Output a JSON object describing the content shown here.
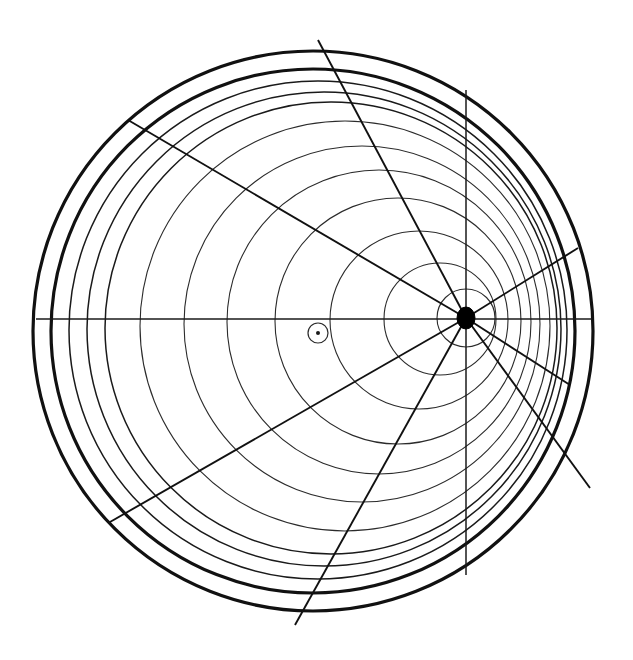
{
  "figure": {
    "kind": "geometric-diagram",
    "background_color": "#ffffff",
    "ink_color": "#111111",
    "canvas": {
      "width": 633,
      "height": 660
    }
  },
  "chart_data": {
    "type": "scatter",
    "subtitle": "",
    "xlabel": "",
    "ylabel": "",
    "xlim": [
      0,
      633
    ],
    "ylim": [
      660,
      0
    ],
    "grid": false,
    "legend": "none",
    "annotations": [],
    "tick_labels": {
      "x": [],
      "y": []
    },
    "geometry": {
      "primary_center": {
        "x": 313,
        "y": 331,
        "label": ""
      },
      "secondary_center": {
        "x": 318,
        "y": 333,
        "label": ""
      },
      "eccentric_node": {
        "x": 466,
        "y": 318,
        "label": ""
      },
      "node_radius": 9,
      "node_ring_radius": 29,
      "marker_ring_radius": 10,
      "marker_dot_radius": 2,
      "circles": [
        {
          "cx": 313,
          "cy": 331,
          "r": 280,
          "weight": "thick"
        },
        {
          "cx": 313,
          "cy": 331,
          "r": 262,
          "weight": "thick"
        },
        {
          "cx": 318,
          "cy": 330,
          "r": 249,
          "weight": "medium"
        },
        {
          "cx": 324,
          "cy": 329,
          "r": 237,
          "weight": "medium"
        },
        {
          "cx": 331,
          "cy": 328,
          "r": 226,
          "weight": "medium"
        },
        {
          "cx": 345,
          "cy": 326,
          "r": 205,
          "weight": "thin"
        },
        {
          "cx": 362,
          "cy": 324,
          "r": 178,
          "weight": "thin"
        },
        {
          "cx": 379,
          "cy": 322,
          "r": 152,
          "weight": "thin"
        },
        {
          "cx": 398,
          "cy": 321,
          "r": 123,
          "weight": "thin"
        },
        {
          "cx": 419,
          "cy": 320,
          "r": 89,
          "weight": "thin"
        },
        {
          "cx": 440,
          "cy": 319,
          "r": 56,
          "weight": "thin"
        },
        {
          "cx": 466,
          "cy": 318,
          "r": 29,
          "weight": "thin"
        }
      ],
      "lines": [
        {
          "name": "horizontal-axis",
          "x1": 36,
          "y1": 319,
          "x2": 592,
          "y2": 319,
          "weight": "axis"
        },
        {
          "name": "vertical-axis",
          "x1": 466,
          "y1": 90,
          "x2": 466,
          "y2": 575,
          "weight": "axis"
        },
        {
          "name": "ray-upper-left",
          "x1": 466,
          "y1": 318,
          "x2": 128,
          "y2": 120,
          "weight": "ray"
        },
        {
          "name": "ray-top",
          "x1": 466,
          "y1": 318,
          "x2": 318,
          "y2": 40,
          "weight": "ray"
        },
        {
          "name": "ray-lower-left",
          "x1": 466,
          "y1": 318,
          "x2": 110,
          "y2": 522,
          "weight": "ray"
        },
        {
          "name": "ray-bottom",
          "x1": 466,
          "y1": 318,
          "x2": 295,
          "y2": 625,
          "weight": "ray"
        },
        {
          "name": "ray-upper-right",
          "x1": 466,
          "y1": 318,
          "x2": 578,
          "y2": 248,
          "weight": "ray"
        },
        {
          "name": "ray-lower-right",
          "x1": 466,
          "y1": 318,
          "x2": 590,
          "y2": 488,
          "weight": "ray"
        },
        {
          "name": "ray-right-short",
          "x1": 466,
          "y1": 318,
          "x2": 570,
          "y2": 385,
          "weight": "ray"
        }
      ]
    },
    "counts": {
      "circles": 12,
      "thick_circles": 2,
      "rays": 7,
      "axes": 2,
      "markers": 2
    }
  }
}
